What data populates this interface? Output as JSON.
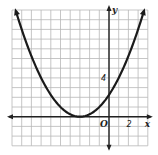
{
  "chart_data": {
    "type": "line",
    "title": "",
    "xlabel": "x",
    "ylabel": "y",
    "origin_label": "O",
    "xlim": [
      -10,
      4
    ],
    "ylim": [
      -3,
      11
    ],
    "grid": true,
    "tick_labels": {
      "x": [
        "2"
      ],
      "y": [
        "4"
      ]
    },
    "series": [
      {
        "name": "parabola",
        "equation": "y = (x + 3)^2 / 4",
        "vertex": [
          -3,
          0
        ],
        "y_intercept": 2.25,
        "x": [
          -9.6,
          -9,
          -8,
          -7,
          -6,
          -5,
          -4,
          -3,
          -2,
          -1,
          0,
          1,
          2,
          3.6
        ],
        "y": [
          10.9,
          9,
          6.25,
          4,
          2.25,
          1,
          0.25,
          0,
          0.25,
          1,
          2.25,
          4,
          6.25,
          10.9
        ]
      }
    ],
    "colors": {
      "grid": "#b8b8b8",
      "axis": "#222222",
      "curve": "#1a1a1a"
    }
  }
}
